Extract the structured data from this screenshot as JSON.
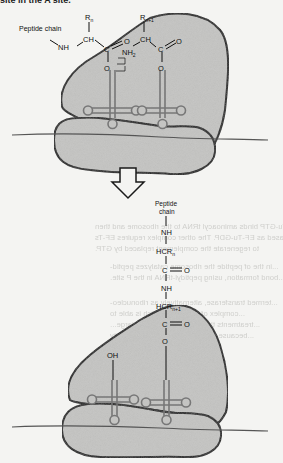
{
  "figure": {
    "top_caption_fragment": "site in the A site.",
    "panel_top": {
      "peptide_chain_label": "Peptide chain",
      "groups": {
        "nh": "NH",
        "r_n": "R",
        "r_n_sub": "n",
        "r_n1": "R",
        "r_n1_sub": "n+1",
        "ch_left": "CH",
        "ch_right": "CH",
        "c_left": "C",
        "c_right": "C",
        "o_left_dbl": "O",
        "o_right_dbl": "O",
        "o_left_ester": "O",
        "o_right_ester": "O",
        "nh2": "NH",
        "nh2_sub": "2"
      }
    },
    "arrow": {
      "direction": "down",
      "icon": "hollow-down-arrow"
    },
    "panel_bottom": {
      "peptide_chain_label_line1": "Peptide",
      "peptide_chain_label_line2": "chain",
      "chain": {
        "nh_top": "NH",
        "hcr_n": "HCR",
        "hcr_n_sub": "n",
        "c": "C",
        "o": "O",
        "nh": "NH",
        "hcr_n1": "HCR",
        "hcr_n1_sub": "n+1",
        "c2": "C",
        "o2": "O",
        "o_ester": "O"
      },
      "oh_label": "OH"
    }
  },
  "bleed_through_text": [
    "GTP",
    "EF-Tu-GTP binds aminoacyl tRNA to the ribosome and then",
    "released as EF-Tu-GDP. The other complex requires EF-Ts",
    "to regenerate the complement replaced by GTP.",
    "...in the of peptide the ribosome catalyzes peptid-",
    "...bond formation, using peptidyl-tRNA in the P site.",
    "...",
    "...termed transferase, alternatively as ribonucleo-",
    "...complex of reactants, which is able to",
    "...treatments that remove proteins, a large...",
    "...because the peptidyl transferase activity",
    "...catalytic RNA...",
    "...the peptide bond...",
    "...activity...",
    "...translocation...",
    "...process..."
  ],
  "colors": {
    "page_bg": "#f4f4f2",
    "ribosome_fill": "#c4c4c2",
    "outline": "#1a1a1a",
    "trna": "#777777",
    "bleed_text": "#cfcfcc"
  }
}
